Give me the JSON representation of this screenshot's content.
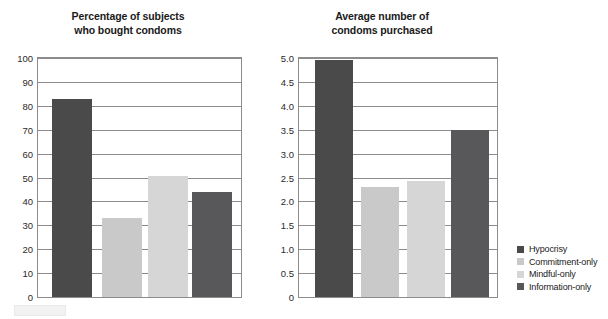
{
  "chart_data": [
    {
      "id": "percentage-chart",
      "type": "bar",
      "title": "Percentage of subjects\nwho bought condoms",
      "xlabel": "",
      "ylabel": "",
      "ylim": [
        0,
        100
      ],
      "ytick_step": 10,
      "grid": true,
      "categories": [
        "Hypocrisy",
        "Commitment-only",
        "Mindful-only",
        "Information-only"
      ],
      "values": [
        83,
        33,
        50.5,
        44
      ],
      "yticks": [
        "100",
        "90",
        "80",
        "70",
        "60",
        "50",
        "40",
        "30",
        "20",
        "10",
        "0"
      ],
      "legend_position": "right-outside"
    },
    {
      "id": "average-chart",
      "type": "bar",
      "title": "Average number of\ncondoms purchased",
      "xlabel": "",
      "ylabel": "",
      "ylim": [
        0,
        5
      ],
      "ytick_step": 0.5,
      "grid": true,
      "categories": [
        "Hypocrisy",
        "Commitment-only",
        "Mindful-only",
        "Information-only"
      ],
      "values": [
        4.95,
        2.3,
        2.42,
        3.5
      ],
      "yticks": [
        "5.0",
        "4.5",
        "4.0",
        "3.5",
        "3.0",
        "2.5",
        "2.0",
        "1.5",
        "1.0",
        "0.5",
        "0"
      ],
      "legend_position": "right-outside"
    }
  ],
  "legend": {
    "items": [
      {
        "label": "Hypocrisy",
        "color": "#4a4a4a"
      },
      {
        "label": "Commitment-only",
        "color": "#c9c9c9"
      },
      {
        "label": "Mindful-only",
        "color": "#d6d6d6"
      },
      {
        "label": "Information-only",
        "color": "#58585a"
      }
    ]
  },
  "colors": {
    "series": [
      "#4a4a4a",
      "#c9c9c9",
      "#d6d6d6",
      "#58585a"
    ],
    "axis": "#8c8c8c",
    "text": "#1a1a1a",
    "background": "#ffffff"
  }
}
